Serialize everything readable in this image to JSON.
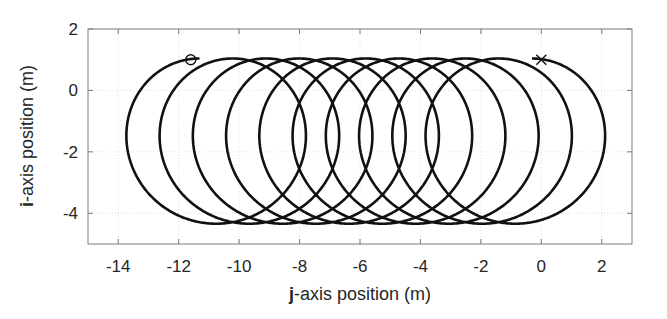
{
  "chart_data": {
    "type": "line",
    "title": "",
    "xlabel": "j-axis position (m)",
    "xlabel_bold": "j",
    "xlabel_rest": "-axis position (m)",
    "ylabel": "i-axis position (m)",
    "ylabel_bold": "i",
    "ylabel_rest": "-axis position (m)",
    "xlim": [
      -15,
      3
    ],
    "ylim": [
      -5,
      2
    ],
    "xticks": [
      -14,
      -12,
      -10,
      -8,
      -6,
      -4,
      -2,
      0,
      2
    ],
    "yticks": [
      2,
      0,
      -2,
      -4
    ],
    "grid": true,
    "legend": null,
    "series": [
      {
        "name": "trajectory",
        "shape": "trochoid loops",
        "center_y": -1.65,
        "radius": 2.69,
        "center_x_start": -11.31,
        "center_x_end": -0.31,
        "turns": 10,
        "start_point": [
          -11.6,
          1.0
        ],
        "end_point": [
          0.0,
          1.0
        ],
        "leftmost_x": -14.0,
        "rightmost_x": 2.38,
        "top_y": 1.03,
        "bottom_y": -4.34,
        "color": "#111111"
      }
    ],
    "markers": [
      {
        "name": "start",
        "symbol": "circle",
        "x": -11.6,
        "y": 1.0
      },
      {
        "name": "end",
        "symbol": "x",
        "x": 0.0,
        "y": 1.0
      }
    ]
  }
}
